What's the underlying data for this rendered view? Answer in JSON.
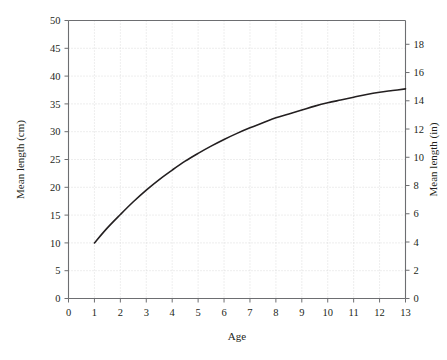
{
  "chart_data": {
    "type": "line",
    "title": "",
    "xlabel": "Age",
    "ylabel": "Mean length (cm)",
    "y2label": "Mean length (in)",
    "xlim": [
      0,
      13
    ],
    "ylim": [
      0,
      50
    ],
    "y2lim": [
      0,
      19.685
    ],
    "xticks": [
      0,
      1,
      2,
      3,
      4,
      5,
      6,
      7,
      8,
      9,
      10,
      11,
      12,
      13
    ],
    "xticklabels": [
      "0",
      "1",
      "2",
      "3",
      "4",
      "5",
      "6",
      "7",
      "8",
      "9",
      "10",
      "11",
      "12",
      "13"
    ],
    "yticks": [
      0,
      5,
      10,
      15,
      20,
      25,
      30,
      35,
      40,
      45,
      50
    ],
    "yticklabels": [
      "0",
      "5",
      "10",
      "15",
      "20",
      "25",
      "30",
      "35",
      "40",
      "45",
      "50"
    ],
    "y2ticks": [
      0,
      2,
      4,
      6,
      8,
      10,
      12,
      14,
      16,
      18
    ],
    "y2ticklabels": [
      "0",
      "2",
      "4",
      "6",
      "8",
      "10",
      "12",
      "14",
      "16",
      "18"
    ],
    "grid": true,
    "grid_style": "dotted",
    "grid_color": "#cfcfcf",
    "legend": null,
    "line_color": "#231f20",
    "line_width": 1.6,
    "x": [
      1,
      1.5,
      2,
      2.5,
      3,
      3.5,
      4,
      4.5,
      5,
      5.5,
      6,
      6.5,
      7,
      7.5,
      8,
      8.5,
      9,
      9.5,
      10,
      10.5,
      11,
      11.5,
      12,
      12.5,
      13
    ],
    "values": [
      10.0,
      12.7,
      15.1,
      17.4,
      19.5,
      21.4,
      23.1,
      24.7,
      26.1,
      27.4,
      28.6,
      29.7,
      30.7,
      31.6,
      32.5,
      33.2,
      33.9,
      34.6,
      35.2,
      35.7,
      36.2,
      36.7,
      37.1,
      37.4,
      37.7
    ],
    "series": [
      {
        "name": "Mean length",
        "x": [
          1,
          1.5,
          2,
          2.5,
          3,
          3.5,
          4,
          4.5,
          5,
          5.5,
          6,
          6.5,
          7,
          7.5,
          8,
          8.5,
          9,
          9.5,
          10,
          10.5,
          11,
          11.5,
          12,
          12.5,
          13
        ],
        "values": [
          10.0,
          12.7,
          15.1,
          17.4,
          19.5,
          21.4,
          23.1,
          24.7,
          26.1,
          27.4,
          28.6,
          29.7,
          30.7,
          31.6,
          32.5,
          33.2,
          33.9,
          34.6,
          35.2,
          35.7,
          36.2,
          36.7,
          37.1,
          37.4,
          37.7
        ]
      }
    ]
  },
  "axes": {
    "x_title": "Age",
    "y_left_title": "Mean length (cm)",
    "y_right_title": "Mean length (in)"
  },
  "colors": {
    "line": "#231f20",
    "axis": "#6d6e71",
    "grid": "#cfcfcf",
    "text": "#231f20",
    "background": "#ffffff"
  }
}
